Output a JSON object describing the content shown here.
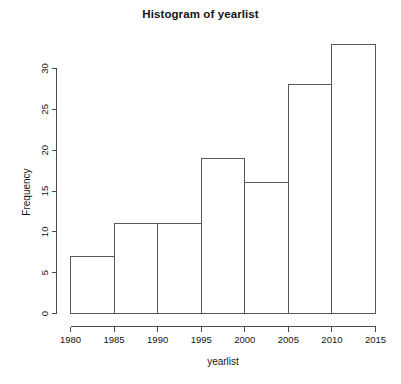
{
  "chart_data": {
    "type": "bar",
    "title": "Histogram of yearlist",
    "xlabel": "yearlist",
    "ylabel": "Frequency",
    "categories": [
      "1980-1985",
      "1985-1990",
      "1990-1995",
      "1995-2000",
      "2000-2005",
      "2005-2010",
      "2010-2015"
    ],
    "bin_edges": [
      1980,
      1985,
      1990,
      1995,
      2000,
      2005,
      2010,
      2015
    ],
    "values": [
      7,
      11,
      11,
      19,
      16,
      28,
      33
    ],
    "xlim": [
      1980,
      2015
    ],
    "ylim": [
      0,
      33
    ],
    "x_ticks": [
      "1980",
      "1985",
      "1990",
      "1995",
      "2000",
      "2005",
      "2010",
      "2015"
    ],
    "x_tick_values": [
      1980,
      1985,
      1990,
      1995,
      2000,
      2005,
      2010,
      2015
    ],
    "y_ticks": [
      "0",
      "5",
      "10",
      "15",
      "20",
      "25",
      "30"
    ],
    "y_tick_values": [
      0,
      5,
      10,
      15,
      20,
      25,
      30
    ],
    "grid": false,
    "legend": false,
    "bar_fill_color": "#ffffff",
    "bar_border_color": "#585858",
    "axis_color": "#4a4a4a",
    "text_color": "#141414",
    "background_color": "#ffffff"
  }
}
